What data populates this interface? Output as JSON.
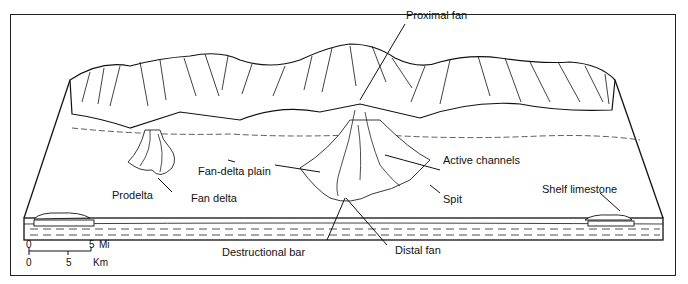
{
  "diagram": {
    "labels": {
      "proximal_fan": "Proximal fan",
      "fan_delta_plain": "Fan-delta plain",
      "active_channels": "Active channels",
      "prodelta": "Prodelta",
      "fan_delta": "Fan delta",
      "spit": "Spit",
      "shelf_limestone": "Shelf limestone",
      "destructional_bar": "Destructional bar",
      "distal_fan": "Distal fan"
    },
    "scale_bar": {
      "mi_start": "0",
      "mi_end": "5",
      "mi_unit": "Mi",
      "km_start": "0",
      "km_mid": "5",
      "km_unit": "Km"
    }
  }
}
